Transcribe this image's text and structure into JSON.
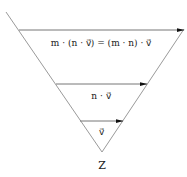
{
  "diagram": {
    "type": "inverted-triangle-vector-scaling",
    "colors": {
      "line": "#9a9a9a",
      "arrow": "#555555",
      "arrowhead": "#111111",
      "text": "#222222"
    },
    "labels": {
      "top_equation": "m · (n · v⃗) = (m · n) · v⃗",
      "middle": "n · v⃗",
      "bottom": "v⃗",
      "vertex": "Z"
    },
    "arrows": [
      {
        "name": "m-n-v",
        "x1": 19,
        "y1": 30,
        "x2": 184,
        "y2": 30
      },
      {
        "name": "n-v",
        "x1": 56,
        "y1": 84,
        "x2": 147,
        "y2": 84
      },
      {
        "name": "v",
        "x1": 80,
        "y1": 121,
        "x2": 123,
        "y2": 121
      }
    ],
    "edges": [
      {
        "name": "left-edge",
        "x1": 6,
        "y1": 12,
        "x2": 102,
        "y2": 152
      },
      {
        "name": "right-edge",
        "x1": 184,
        "y1": 29,
        "x2": 102,
        "y2": 152
      }
    ]
  }
}
